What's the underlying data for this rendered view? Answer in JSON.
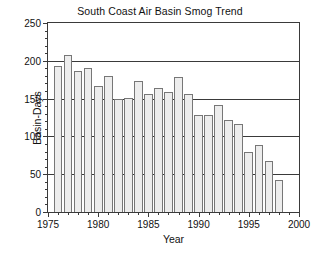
{
  "chart_data": {
    "type": "bar",
    "title": "South Coast Air Basin Smog Trend",
    "xlabel": "Year",
    "ylabel": "Basin-Days",
    "xlim": [
      1975,
      2000
    ],
    "ylim": [
      0,
      250
    ],
    "grid": true,
    "legend": null,
    "y_ticks": [
      0,
      50,
      100,
      150,
      200,
      250
    ],
    "y_tick_labels": [
      "0",
      "50",
      "100",
      "150",
      "200",
      "250"
    ],
    "y_minor_tick_interval": 10,
    "x_ticks": [
      1975,
      1980,
      1985,
      1990,
      1995,
      2000
    ],
    "x_tick_labels": [
      "1975",
      "1980",
      "1985",
      "1990",
      "1995",
      "2000"
    ],
    "x_minor_tick_interval": 1,
    "bar_fill_color": "#ededed",
    "bar_edge_color": "#777777",
    "axis_color": "#3a3a3a",
    "categories": [
      1976,
      1977,
      1978,
      1979,
      1980,
      1981,
      1982,
      1983,
      1984,
      1985,
      1986,
      1987,
      1988,
      1989,
      1990,
      1991,
      1992,
      1993,
      1994,
      1995,
      1996,
      1997,
      1998
    ],
    "values": [
      193,
      208,
      186,
      191,
      167,
      180,
      149,
      151,
      173,
      156,
      164,
      159,
      178,
      156,
      128,
      128,
      142,
      122,
      117,
      79,
      89,
      67,
      43
    ],
    "units": "Basin-Days"
  },
  "chart": {
    "title": "South Coast Air Basin Smog Trend",
    "x_axis_title": "Year",
    "y_axis_title": "Basin-Days"
  }
}
